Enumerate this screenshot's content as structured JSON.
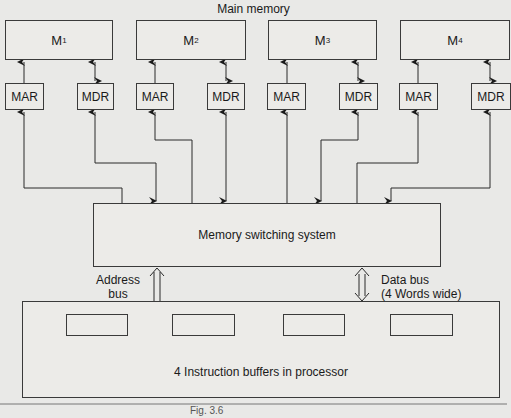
{
  "title": "Main memory",
  "modules": [
    {
      "name": "M",
      "sub": "1",
      "mar": "MAR",
      "mdr": "MDR"
    },
    {
      "name": "M",
      "sub": "2",
      "mar": "MAR",
      "mdr": "MDR"
    },
    {
      "name": "M",
      "sub": "3",
      "mar": "MAR",
      "mdr": "MDR"
    },
    {
      "name": "M",
      "sub": "4",
      "mar": "MAR",
      "mdr": "MDR"
    }
  ],
  "switch": {
    "label": "Memory switching system"
  },
  "address_bus": {
    "line1": "Address",
    "line2": "bus"
  },
  "data_bus": {
    "line1": "Data bus",
    "line2": "(4 Words wide)"
  },
  "processor": {
    "label": "4 Instruction buffers in processor",
    "buffer_count": 4
  },
  "caption": "Fig. 3.6"
}
